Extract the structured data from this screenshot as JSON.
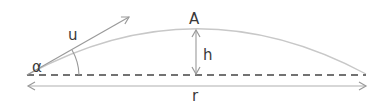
{
  "diagram": {
    "type": "projectile-motion",
    "labels": {
      "velocity": "u",
      "angle": "α",
      "apex": "A",
      "height": "h",
      "range": "r"
    },
    "colors": {
      "trajectory": "#c8c8c8",
      "vector": "#9a9a9a",
      "baseline": "#444444",
      "text": "#3a3a3a"
    }
  }
}
